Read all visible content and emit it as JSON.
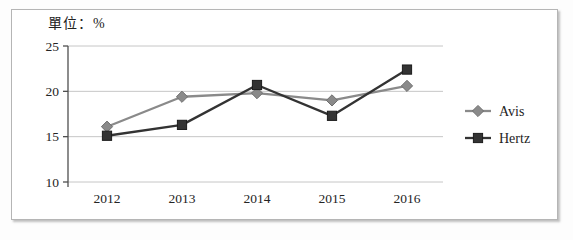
{
  "chart_data": {
    "type": "line",
    "unit_label": "單位：%",
    "title": "",
    "xlabel": "",
    "ylabel": "",
    "categories": [
      "2012",
      "2013",
      "2014",
      "2015",
      "2016"
    ],
    "series": [
      {
        "name": "Avis",
        "values": [
          16.1,
          19.4,
          19.8,
          19.0,
          20.6
        ],
        "color": "#8a8a8a",
        "marker_edge": "#6f6f6f",
        "marker": "diamond"
      },
      {
        "name": "Hertz",
        "values": [
          15.1,
          16.3,
          20.7,
          17.3,
          22.4
        ],
        "color": "#333333",
        "marker_edge": "#1c1c1c",
        "marker": "square"
      }
    ],
    "ylim": [
      10,
      25
    ],
    "ytick_labels": [
      "10",
      "15",
      "20",
      "25"
    ],
    "ytick_values": [
      10,
      15,
      20,
      25
    ],
    "grid": "horizontal",
    "legend_position": "right",
    "colors": {
      "gridline": "#c6c6c6",
      "axis": "#4f4f4f",
      "text": "#242424",
      "frame_border": "#b5b5b5",
      "background": "#ffffff"
    }
  }
}
